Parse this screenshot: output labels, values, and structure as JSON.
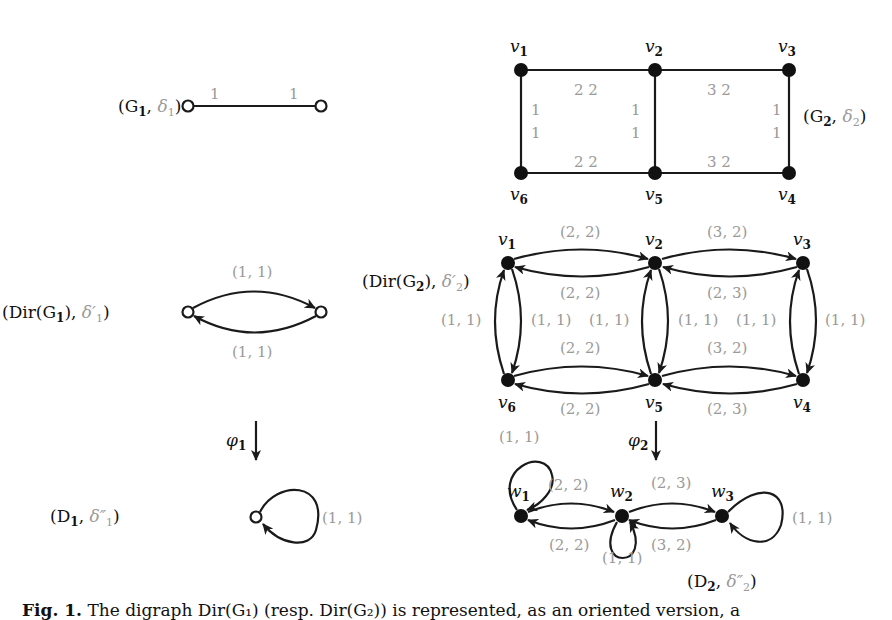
{
  "figure": {
    "graphs": {
      "G1": {
        "label_main": "(G",
        "label_sub": "1",
        "label_delta": "δ",
        "label_delta_sub": "1",
        "edge_weights": [
          "1",
          "1"
        ]
      },
      "G2": {
        "label_main": "(G",
        "label_sub": "2",
        "label_delta": "δ",
        "label_delta_sub": "2",
        "vertices": [
          "v1",
          "v2",
          "v3",
          "v4",
          "v5",
          "v6"
        ],
        "edge_weights": {
          "v1_v2": "2 2",
          "v2_v3": "3 2",
          "v6_v5": "2 2",
          "v5_v4": "3 2",
          "v1_v6": [
            "1",
            "1"
          ],
          "v2_v5": [
            "1",
            "1"
          ],
          "v3_v4": [
            "1",
            "1"
          ]
        }
      },
      "DirG1": {
        "label": "(Dir(G",
        "label_sub": "1",
        "label_delta": "δ′",
        "label_delta_sub": "1",
        "arc_weights": [
          "(1, 1)",
          "(1, 1)"
        ]
      },
      "DirG2": {
        "label": "(Dir(G",
        "label_sub": "2",
        "label_delta": "δ′",
        "label_delta_sub": "2",
        "vertices": [
          "v1",
          "v2",
          "v3",
          "v4",
          "v5",
          "v6"
        ],
        "arc_weights": {
          "v1_v2_top": "(2, 2)",
          "v2_v1_bottom": "(2, 2)",
          "v2_v3_top": "(3, 2)",
          "v3_v2_bottom": "(2, 3)",
          "v6_v5_top": "(2, 2)",
          "v5_v6_bottom": "(2, 2)",
          "v5_v4_top": "(3, 2)",
          "v4_v5_bottom": "(2, 3)",
          "v1_v6_left": "(1, 1)",
          "v1_v6_right": "(1, 1)",
          "v2_v5_left": "(1, 1)",
          "v2_v5_right": "(1, 1)",
          "v3_v4_left": "(1, 1)",
          "v3_v4_right": "(1, 1)"
        }
      },
      "D1": {
        "label": "(D",
        "label_sub": "1",
        "label_delta": "δ″",
        "label_delta_sub": "1",
        "loop_weight": "(1, 1)",
        "map_label": "φ",
        "map_sub": "1"
      },
      "D2": {
        "label": "(D",
        "label_sub": "2",
        "label_delta": "δ″",
        "label_delta_sub": "2",
        "vertices": [
          "w1",
          "w2",
          "w3"
        ],
        "map_label": "φ",
        "map_sub": "2",
        "weights": {
          "w1_loop": "(1, 1)",
          "w1_w2_top": "(2, 2)",
          "w2_w1_bottom": "(2, 2)",
          "w2_loop": "(1, 1)",
          "w2_w3_top": "(2, 3)",
          "w3_w2_bottom": "(3, 2)",
          "w3_loop": "(1, 1)"
        }
      }
    },
    "caption": {
      "prefix": "Fig. 1.",
      "text": "The digraph Dir(G₁) (resp. Dir(G₂)) is represented, as an oriented version, a"
    }
  }
}
